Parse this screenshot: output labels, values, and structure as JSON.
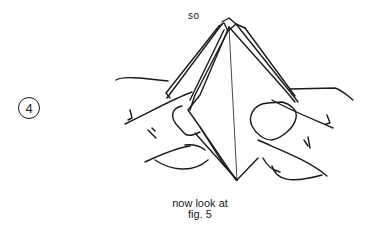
{
  "figure": {
    "step_number": "4",
    "top_label": "so",
    "caption_line1": "now look at",
    "caption_line2": "fig. 5",
    "illustration": "hands-holding-folded-paper-pyramid",
    "line_color": "#1a1a1a",
    "background_color": "#ffffff"
  }
}
